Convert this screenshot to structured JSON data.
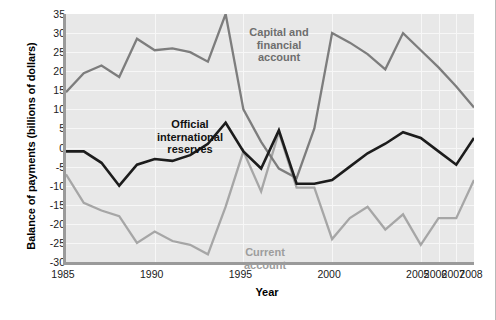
{
  "chart_data": {
    "type": "line",
    "title": "",
    "xlabel": "Year",
    "ylabel": "Balance of payments (billions of dollars)",
    "categories": [
      "1985",
      "1986",
      "1987",
      "1988",
      "1989",
      "1990",
      "1991",
      "1992",
      "1993",
      "1994",
      "1995",
      "1996",
      "1997",
      "1998",
      "1999",
      "2000",
      "2001",
      "2002",
      "2003",
      "2004",
      "2005",
      "2006",
      "2007",
      "2008"
    ],
    "tick_labels": [
      "1985",
      "1990",
      "1995",
      "2000",
      "2005",
      "2006",
      "2007",
      "2008"
    ],
    "tick_index": [
      0,
      5,
      10,
      15,
      20,
      21,
      22,
      23
    ],
    "axis_note": "x axis is irregular: five-year steps 1985-2005 then yearly 2005-2008, drawn evenly spaced",
    "ylim": [
      -30,
      35
    ],
    "ytick_values": [
      35,
      30,
      25,
      20,
      15,
      10,
      5,
      0,
      -5,
      -10,
      -15,
      -20,
      -25,
      -30
    ],
    "ytick_labels": [
      "35",
      "30",
      "25",
      "20",
      "15",
      "10",
      "5",
      "0",
      "-5",
      "-10",
      "-15",
      "-20",
      "-25",
      "-30"
    ],
    "grid": true,
    "legend_position": "inline-annotations",
    "series": [
      {
        "name": "Capital and financial account",
        "color": "#7d7d7d",
        "values": [
          14.5,
          19.5,
          21.5,
          18.5,
          28.5,
          25.5,
          26.0,
          25.0,
          22.5,
          35.0,
          10.0,
          1.5,
          -5.5,
          -8.0,
          5.0,
          30.0,
          27.5,
          24.5,
          20.5,
          30.0,
          25.5,
          21.0,
          16.0,
          10.5
        ]
      },
      {
        "name": "Official international reserves",
        "color": "#1c1c1c",
        "values": [
          -1.0,
          -1.0,
          -4.0,
          -10.0,
          -4.5,
          -3.0,
          -3.5,
          -2.0,
          1.0,
          6.5,
          -1.0,
          -5.5,
          4.5,
          -9.5,
          -9.5,
          -8.5,
          -5.0,
          -1.5,
          1.0,
          4.0,
          2.5,
          -1.0,
          -4.5,
          2.5
        ]
      },
      {
        "name": "Current account",
        "color": "#a6a6a6",
        "values": [
          -7.0,
          -14.5,
          -16.5,
          -18.0,
          -25.0,
          -22.0,
          -24.5,
          -25.5,
          -28.0,
          -15.5,
          -1.0,
          -11.5,
          4.0,
          -10.5,
          -10.5,
          -24.0,
          -18.5,
          -15.5,
          -21.5,
          -17.5,
          -25.5,
          -18.5,
          -18.5,
          -8.5
        ]
      }
    ]
  },
  "annotations": {
    "capital": "Capital and\nfinancial\naccount",
    "reserves": "Official\ninternational\nreserves",
    "current": "Current\naccount"
  },
  "caption": {
    "text": ""
  }
}
